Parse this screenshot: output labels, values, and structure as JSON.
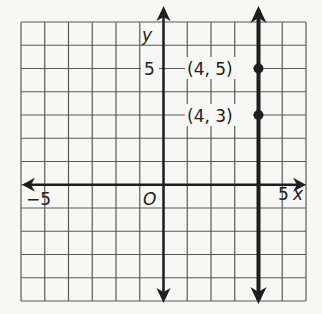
{
  "chart_data": {
    "type": "line",
    "title": "",
    "xlabel": "x",
    "ylabel": "y",
    "xlim": [
      -6,
      6
    ],
    "ylim": [
      -5,
      7
    ],
    "grid": true,
    "grid_step": 1,
    "tick_labels": {
      "x": [
        {
          "value": -5,
          "label": "−5"
        },
        {
          "value": 5,
          "label": "5"
        }
      ],
      "y": [
        {
          "value": 5,
          "label": "5"
        }
      ]
    },
    "origin_label": "O",
    "series": [
      {
        "name": "vertical line x = 4",
        "kind": "vertical_line",
        "x": 4,
        "arrows": "both"
      }
    ],
    "points": [
      {
        "x": 4,
        "y": 5,
        "label": "(4, 5)"
      },
      {
        "x": 4,
        "y": 3,
        "label": "(4, 3)"
      }
    ],
    "colors": {
      "background": "#f7f7f5",
      "grid": "#5a5a5a",
      "axis": "#1e1e1e",
      "line": "#1e1e1e",
      "point": "#1e1e1e"
    }
  }
}
